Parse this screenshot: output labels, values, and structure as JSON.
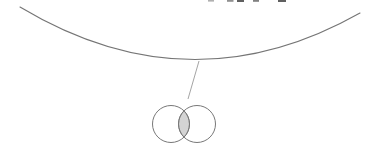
{
  "canvas": {
    "width": 365,
    "height": 161,
    "background": "#ffffff"
  },
  "colors": {
    "arc_stroke": "#757575",
    "pointer_stroke": "#9a9a9a",
    "circle_stroke": "#787878",
    "lens_fill": "#d4d4d4",
    "lens_stroke": "#8c8c8c"
  },
  "large_arc": {
    "path": "M 20 7 Q 190 109 360 13",
    "stroke_width": "1.1"
  },
  "pointer_line": {
    "x1": "199",
    "y1": "61",
    "x2": "188",
    "y2": "99",
    "stroke_width": "0.9"
  },
  "venn": {
    "left_circle": {
      "cx": "171",
      "cy": "124",
      "r": "18.5"
    },
    "right_circle": {
      "cx": "197",
      "cy": "124",
      "r": "18.5"
    },
    "intersection_path": "M 184 110.84 A 18.5 18.5 0 0 1 184 137.16 A 18.5 18.5 0 0 1 184 110.84 Z",
    "circle_stroke_width": "1"
  },
  "cropped_text_marks": [
    {
      "d": "M208 0 h6 v1.6 h-6 Z",
      "color": "#b0b0b0"
    },
    {
      "d": "M227 0 h6.5 v1.8 h-6.5 Z",
      "color": "#909090"
    },
    {
      "d": "M237 0 h7 v2 h-7 Z",
      "color": "#606060"
    },
    {
      "d": "M253 0 h6 v1.8 h-6 Z",
      "color": "#808080"
    },
    {
      "d": "M278 0 h8 v2 h-8 Z",
      "color": "#606060"
    }
  ]
}
